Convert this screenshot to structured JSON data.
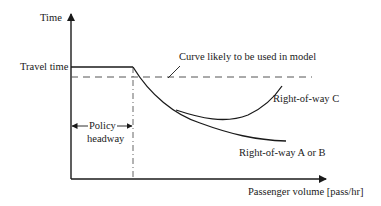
{
  "diagram": {
    "y_axis_label": "Time",
    "x_axis_label": "Passenger volume [pass/hr]",
    "travel_time_label": "Travel time",
    "curve_model_label": "Curve likely to be used in model",
    "right_of_way_c_label": "Right-of-way C",
    "right_of_way_ab_label": "Right-of-way A or B",
    "policy_headway_label_line1": "Policy",
    "policy_headway_label_line2": "headway",
    "colors": {
      "line": "#1a1a1a",
      "dashed": "#555555",
      "background": "#ffffff"
    }
  }
}
